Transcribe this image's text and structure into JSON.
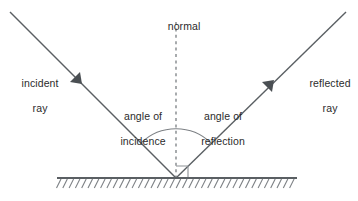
{
  "diagram": {
    "background_color": "#ffffff",
    "line_color": "#5a5f63",
    "text_color": "#2b2b2b",
    "labels": {
      "normal": "normal",
      "incident_ray_line1": "incident",
      "incident_ray_line2": "ray",
      "reflected_ray_line1": "reflected",
      "reflected_ray_line2": "ray",
      "angle_of_incidence_line1": "angle of",
      "angle_of_incidence_line2": "incidence",
      "angle_of_reflection_line1": "angle of",
      "angle_of_reflection_line2": "reflection"
    },
    "geometry": {
      "vertex_x": 176,
      "vertex_y": 178,
      "incident_start_x": 10,
      "incident_start_y": 12,
      "reflected_end_x": 346,
      "reflected_end_y": 12,
      "normal_top_y": 22,
      "surface_left_x": 57,
      "surface_right_x": 297,
      "surface_y": 178,
      "hatch_count": 38,
      "hatch_spacing": 6.3,
      "hatch_length": 9,
      "arc_radius": 50,
      "right_angle_size": 11
    }
  }
}
